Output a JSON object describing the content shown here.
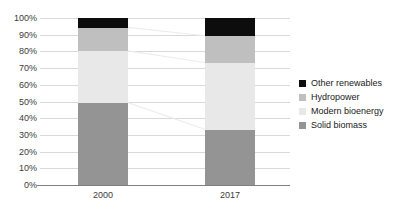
{
  "chart_data": {
    "type": "bar",
    "subtype": "stacked-percentage",
    "title": "",
    "xlabel": "",
    "ylabel": "",
    "categories": [
      "2000",
      "2017"
    ],
    "ylim": [
      0,
      100
    ],
    "y_tick_labels": [
      "0%",
      "10%",
      "20%",
      "30%",
      "40%",
      "50%",
      "60%",
      "70%",
      "80%",
      "90%",
      "100%"
    ],
    "y_tick_values": [
      0,
      10,
      20,
      30,
      40,
      50,
      60,
      70,
      80,
      90,
      100
    ],
    "grid": true,
    "legend_position": "right",
    "series": [
      {
        "name": "Other renewables",
        "values": [
          6,
          11
        ],
        "color": "#0d0d0d"
      },
      {
        "name": "Hydropower",
        "values": [
          14,
          16
        ],
        "color": "#bfbfbf"
      },
      {
        "name": "Modern bioenergy",
        "values": [
          31,
          40
        ],
        "color": "#e8e8e8"
      },
      {
        "name": "Solid biomass",
        "values": [
          49,
          33
        ],
        "color": "#949494"
      }
    ],
    "stack_order_bottom_to_top": [
      "Solid biomass",
      "Modern bioenergy",
      "Hydropower",
      "Other renewables"
    ],
    "connectors": true
  },
  "legend": {
    "items": [
      {
        "label": "Other renewables",
        "color": "#0d0d0d"
      },
      {
        "label": "Hydropower",
        "color": "#bfbfbf"
      },
      {
        "label": "Modern bioenergy",
        "color": "#e8e8e8"
      },
      {
        "label": "Solid biomass",
        "color": "#949494"
      }
    ]
  },
  "axis": {
    "y_labels": [
      "100%",
      "90%",
      "80%",
      "70%",
      "60%",
      "50%",
      "40%",
      "30%",
      "20%",
      "10%",
      "0%"
    ],
    "x_labels": [
      "2000",
      "2017"
    ]
  },
  "colors": {
    "grid": "#d9d9d9",
    "axis": "#7f7f7f",
    "connector": "#ededed",
    "text": "#3b3b3b",
    "background": "#ffffff"
  }
}
